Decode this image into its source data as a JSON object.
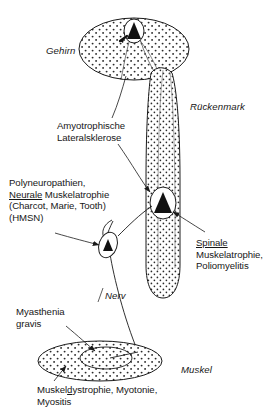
{
  "figure": {
    "language": "de",
    "stroke_color": "#1a1a1a",
    "fill_color": "#ffffff",
    "stipple_color": "#2a2a2a",
    "neuron_fill": "#111111"
  },
  "anatomy": {
    "brain": {
      "name": "Gehirn",
      "label": "Gehirn",
      "style": "italic"
    },
    "spinal_cord": {
      "name": "Rückenmark",
      "label": "Rückenmark",
      "style": "italic"
    },
    "nerve": {
      "name": "Nerv",
      "label": "Nerv",
      "style": "italic"
    },
    "muscle": {
      "name": "Muskel",
      "label": "Muskel",
      "style": "italic"
    }
  },
  "disease_labels": {
    "als": {
      "lines": [
        "Amyotrophische",
        "Lateralsklerose"
      ],
      "line1": "Amyotrophische",
      "line2": "Lateralsklerose",
      "underline": ""
    },
    "polyneuropathien": {
      "line1": "Polyneuropathien,",
      "line2_underlined": "Neurale",
      "line2_rest": " Muskelatrophie",
      "line3": "(Charcot, Marie, Tooth)",
      "line4": "(HMSN)"
    },
    "spinale": {
      "line1_underlined": "Spinale",
      "line2": "Muskelatrophie,",
      "line3": "Poliomyelitis"
    },
    "myasthenia": {
      "line1": "Myasthenia",
      "line2": "gravis"
    },
    "muskeldystrophie": {
      "line1_a": "Muskel",
      "line1_underlined": "d",
      "line1_b": "ystrophie, Myotonie,",
      "line1_full": "Muskeldystrophie, Myotonie,",
      "line2": "Myositis"
    }
  },
  "neurons": {
    "upper_motor_neuron": {
      "name": "erstes Motoneuron",
      "location": "Gehirn"
    },
    "lower_motor_neuron": {
      "name": "zweites Motoneuron",
      "location": "Rückenmark"
    },
    "peripheral_ganglion": {
      "name": "peripheres Neuron",
      "location": "Nerv"
    },
    "motor_endplate": {
      "name": "motorische Endplatte",
      "location": "Muskel"
    }
  }
}
